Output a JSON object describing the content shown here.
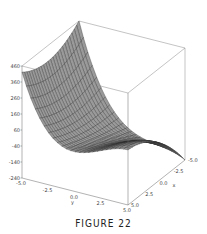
{
  "caption": "FIGURE 22",
  "chart_data": {
    "type": "surface3d",
    "title": "",
    "xlabel": "x",
    "ylabel": "y",
    "zlabel": "",
    "x_ticks": [
      "-5.0",
      "-2.5",
      "0.0",
      "2.5",
      "5.0"
    ],
    "y_ticks": [
      "-5.0",
      "-2.5",
      "0.0",
      "2.5",
      "5.0"
    ],
    "z_ticks": [
      "460",
      "360",
      "260",
      "160",
      "60",
      "-40",
      "-140",
      "-240"
    ],
    "xlim": [
      -5,
      5
    ],
    "ylim": [
      -5,
      5
    ],
    "zlim": [
      -240,
      460
    ],
    "grid": "surface mesh 25x25",
    "box": true,
    "colors": {
      "surface": "#9a9a9a",
      "mesh": "#2e2e2e",
      "box": "#777777"
    }
  }
}
